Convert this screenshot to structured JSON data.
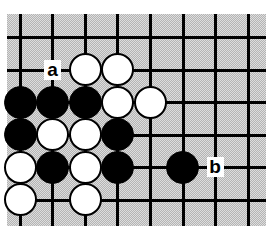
{
  "figure": {
    "kind": "go-board-diagram",
    "board": {
      "background_color": "#b4b4b4",
      "line_color": "#000000",
      "margin_color": "#ffffff",
      "cell_size": 32.5,
      "columns": 8,
      "rows": 6,
      "origin_x": 20,
      "origin_y": 37,
      "vertical_lines_x": [
        20,
        52,
        85,
        117,
        150,
        183,
        215,
        248
      ],
      "horizontal_lines_y": [
        37,
        70,
        102,
        135,
        167,
        200
      ]
    },
    "stones": [
      {
        "color": "white",
        "col": 2,
        "row": 1
      },
      {
        "color": "white",
        "col": 3,
        "row": 1
      },
      {
        "color": "black",
        "col": 0,
        "row": 2
      },
      {
        "color": "black",
        "col": 1,
        "row": 2
      },
      {
        "color": "black",
        "col": 2,
        "row": 2
      },
      {
        "color": "white",
        "col": 3,
        "row": 2
      },
      {
        "color": "white",
        "col": 4,
        "row": 2
      },
      {
        "color": "black",
        "col": 0,
        "row": 3
      },
      {
        "color": "white",
        "col": 1,
        "row": 3
      },
      {
        "color": "white",
        "col": 2,
        "row": 3
      },
      {
        "color": "black",
        "col": 3,
        "row": 3
      },
      {
        "color": "white",
        "col": 0,
        "row": 4
      },
      {
        "color": "black",
        "col": 1,
        "row": 4
      },
      {
        "color": "white",
        "col": 2,
        "row": 4
      },
      {
        "color": "black",
        "col": 3,
        "row": 4
      },
      {
        "color": "black",
        "col": 5,
        "row": 4
      },
      {
        "color": "white",
        "col": 0,
        "row": 5
      },
      {
        "color": "white",
        "col": 2,
        "row": 5
      }
    ],
    "markers": [
      {
        "label": "a",
        "col": 1,
        "row": 1
      },
      {
        "label": "b",
        "col": 6,
        "row": 4
      }
    ]
  }
}
